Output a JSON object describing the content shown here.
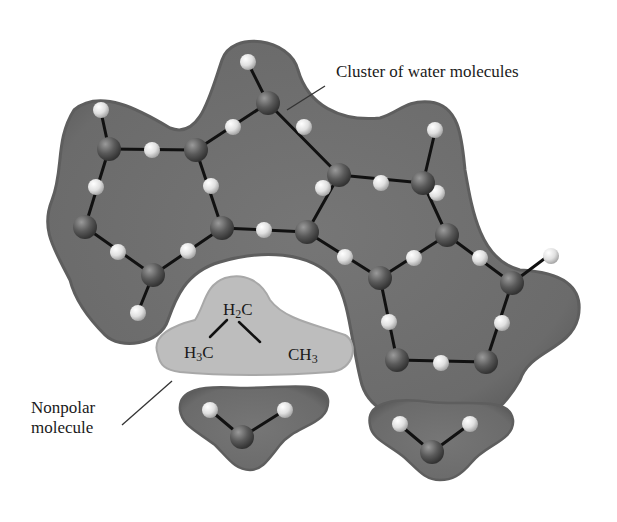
{
  "figure": {
    "labels": {
      "cluster": "Cluster of water molecules",
      "nonpolar_line1": "Nonpolar",
      "nonpolar_line2": "molecule"
    },
    "nonpolar_molecule": {
      "top_group": {
        "main": "H",
        "sub": "2",
        "tail": "C"
      },
      "left_group": {
        "main": "H",
        "sub": "3",
        "tail": "C"
      },
      "right_group": {
        "main": "CH",
        "sub": "3",
        "tail": ""
      }
    },
    "colors": {
      "cluster_fill": "#6e6e6e",
      "cluster_edge": "#5a5a5a",
      "nonpolar_fill": "#bdbdbd",
      "oxygen_atom": "#555555",
      "hydrogen_atom": "#e6e6e6",
      "bond": "#111111",
      "background": "#ffffff"
    }
  }
}
